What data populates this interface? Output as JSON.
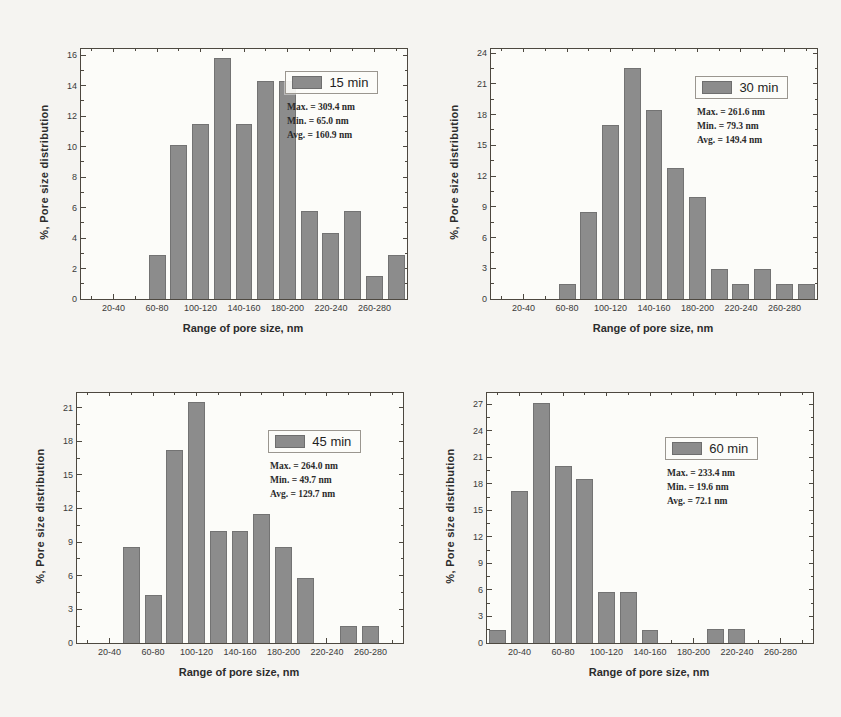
{
  "page": {
    "background": "#f5f4f1",
    "bar_color": "#8c8c8c"
  },
  "shared": {
    "ylabel": "%, Pore size distribution",
    "xlabel": "Range of pore size, nm",
    "xtick_labels": [
      "20-40",
      "60-80",
      "100-120",
      "140-160",
      "180-200",
      "220-240",
      "260-280"
    ]
  },
  "chart_data": [
    {
      "type": "bar",
      "legend": "15 min",
      "categories": [
        "0-20",
        "20-40",
        "40-60",
        "60-80",
        "80-100",
        "100-120",
        "120-140",
        "140-160",
        "160-180",
        "180-200",
        "200-220",
        "220-240",
        "240-260",
        "260-280",
        "280-300"
      ],
      "values": [
        0,
        0,
        0,
        2.9,
        10.1,
        11.5,
        15.8,
        11.5,
        14.3,
        14.3,
        5.8,
        4.3,
        5.8,
        1.5,
        2.9
      ],
      "yticks": [
        0,
        2,
        4,
        6,
        8,
        10,
        12,
        14,
        16
      ],
      "ylim": [
        0,
        16.4
      ],
      "xlabel": "Range of pore size, nm",
      "ylabel": "%, Pore size distribution",
      "grid": false,
      "legend_position": "top-right-inside",
      "legend_pos": {
        "left_pct": 63,
        "top_pct": 9
      },
      "stats": [
        "Max. = 309.4 nm",
        "Min. = 65.0 nm",
        "Avg. = 160.9 nm"
      ]
    },
    {
      "type": "bar",
      "legend": "30 min",
      "categories": [
        "0-20",
        "20-40",
        "40-60",
        "60-80",
        "80-100",
        "100-120",
        "120-140",
        "140-160",
        "160-180",
        "180-200",
        "200-220",
        "220-240",
        "240-260",
        "260-280",
        "280-300"
      ],
      "values": [
        0,
        0,
        0,
        1.5,
        8.5,
        17.0,
        22.5,
        18.4,
        12.8,
        10.0,
        2.9,
        1.5,
        2.9,
        1.5,
        1.5
      ],
      "yticks": [
        0,
        3,
        6,
        9,
        12,
        15,
        18,
        21,
        24
      ],
      "ylim": [
        0,
        24.4
      ],
      "xlabel": "Range of pore size, nm",
      "ylabel": "%, Pore size distribution",
      "grid": false,
      "legend_position": "top-right-inside",
      "legend_pos": {
        "left_pct": 63,
        "top_pct": 11
      },
      "stats": [
        "Max. = 261.6 nm",
        "Min. = 79.3 nm",
        "Avg. = 149.4 nm"
      ]
    },
    {
      "type": "bar",
      "legend": "45 min",
      "categories": [
        "0-20",
        "20-40",
        "40-60",
        "60-80",
        "80-100",
        "100-120",
        "120-140",
        "140-160",
        "160-180",
        "180-200",
        "200-220",
        "220-240",
        "240-260",
        "260-280",
        "280-300"
      ],
      "values": [
        0,
        0,
        8.6,
        4.3,
        17.2,
        21.5,
        10.0,
        10.0,
        11.5,
        8.6,
        5.8,
        0,
        1.5,
        1.5,
        0
      ],
      "yticks": [
        0,
        3,
        6,
        9,
        12,
        15,
        18,
        21
      ],
      "ylim": [
        0,
        22.3
      ],
      "xlabel": "Range of pore size, nm",
      "ylabel": "%, Pore size distribution",
      "grid": false,
      "legend_position": "top-right-inside",
      "legend_pos": {
        "left_pct": 59,
        "top_pct": 15
      },
      "stats": [
        "Max. = 264.0 nm",
        "Min. = 49.7 nm",
        "Avg. = 129.7 nm"
      ]
    },
    {
      "type": "bar",
      "legend": "60 min",
      "categories": [
        "0-20",
        "20-40",
        "40-60",
        "60-80",
        "80-100",
        "100-120",
        "120-140",
        "140-160",
        "160-180",
        "180-200",
        "200-220",
        "220-240",
        "240-260",
        "260-280",
        "280-300"
      ],
      "values": [
        1.5,
        17.2,
        27.2,
        20.0,
        18.6,
        5.8,
        5.8,
        1.5,
        0,
        0,
        1.6,
        1.6,
        0,
        0,
        0
      ],
      "yticks": [
        0,
        3,
        6,
        9,
        12,
        15,
        18,
        21,
        24,
        27
      ],
      "ylim": [
        0,
        28.3
      ],
      "xlabel": "Range of pore size, nm",
      "ylabel": "%, Pore size distribution",
      "grid": false,
      "legend_position": "top-right-inside",
      "legend_pos": {
        "left_pct": 55,
        "top_pct": 18
      },
      "stats": [
        "Max. = 233.4 nm",
        "Min. = 19.6 nm",
        "Avg. = 72.1 nm"
      ]
    }
  ]
}
